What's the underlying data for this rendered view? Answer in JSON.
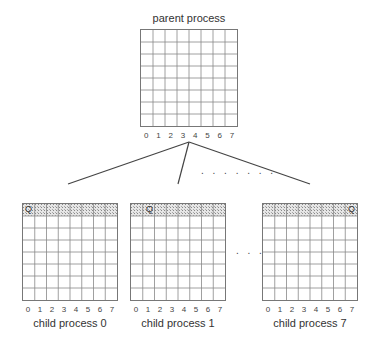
{
  "parent": {
    "title": "parent process",
    "columns": [
      "0",
      "1",
      "2",
      "3",
      "4",
      "5",
      "6",
      "7"
    ],
    "rows": 8
  },
  "children": [
    {
      "label": "child process 0",
      "q_column": 0,
      "columns": [
        "0",
        "1",
        "2",
        "3",
        "4",
        "5",
        "6",
        "7"
      ],
      "rows": 8
    },
    {
      "label": "child process 1",
      "q_column": 1,
      "columns": [
        "0",
        "1",
        "2",
        "3",
        "4",
        "5",
        "6",
        "7"
      ],
      "rows": 8
    },
    {
      "label": "child process 7",
      "q_column": 7,
      "columns": [
        "0",
        "1",
        "2",
        "3",
        "4",
        "5",
        "6",
        "7"
      ],
      "rows": 8
    }
  ],
  "queen_symbol": "Q",
  "ellipsis_lines": ". . . . . . .",
  "ellipsis_children": ". . .",
  "colors": {
    "grid_line": "#777777",
    "shaded_row": "#d8d8d8",
    "connector": "#444444"
  }
}
